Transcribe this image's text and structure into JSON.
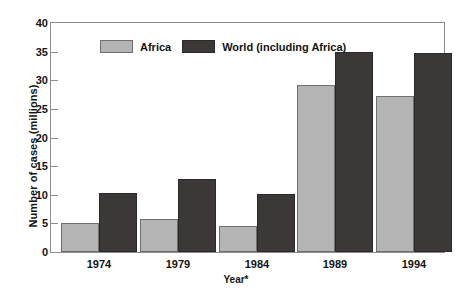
{
  "chart_data": {
    "type": "bar",
    "title": "",
    "xlabel": "Year*",
    "ylabel": "Number of cases (millions)",
    "categories": [
      "1974",
      "1979",
      "1984",
      "1989",
      "1994"
    ],
    "series": [
      {
        "name": "Africa",
        "color": "#b4b4b4",
        "values": [
          5.0,
          5.7,
          4.5,
          29.2,
          27.3
        ]
      },
      {
        "name": "World (including Africa)",
        "color": "#3c3838",
        "values": [
          10.3,
          12.8,
          10.2,
          35.0,
          34.8
        ]
      }
    ],
    "ylim": [
      0,
      40
    ],
    "yticks": [
      0,
      5,
      10,
      15,
      20,
      25,
      30,
      35,
      40
    ],
    "ytick_labels": [
      "0",
      "5",
      "10",
      "15",
      "20",
      "25",
      "30",
      "35",
      "40"
    ],
    "grid": false,
    "legend_position": "inside-top-left",
    "frame_color": "#8d8d8d"
  },
  "legend": {
    "entries": [
      {
        "label": "Africa"
      },
      {
        "label": "World (including Africa)"
      }
    ]
  }
}
